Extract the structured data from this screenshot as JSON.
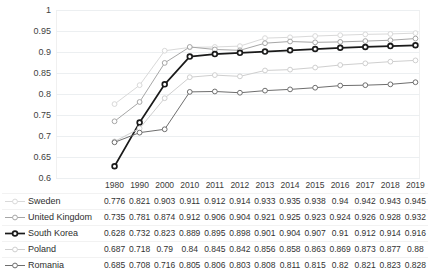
{
  "chart_data": {
    "type": "line",
    "title": "",
    "xlabel": "",
    "ylabel": "",
    "ylim": [
      0.6,
      1
    ],
    "yticks": [
      "0.6",
      "0.65",
      "0.7",
      "0.75",
      "0.8",
      "0.85",
      "0.9",
      "0.95",
      "1"
    ],
    "grid": true,
    "legend_position": "table-left",
    "categories": [
      "1980",
      "1990",
      "2000",
      "2010",
      "2011",
      "2012",
      "2013",
      "2014",
      "2015",
      "2016",
      "2017",
      "2018",
      "2019"
    ],
    "series": [
      {
        "name": "Sweden",
        "color": "#d9d9d9",
        "marker": "circle-open",
        "values": [
          0.776,
          0.821,
          0.903,
          0.911,
          0.912,
          0.914,
          0.933,
          0.935,
          0.938,
          0.94,
          0.942,
          0.943,
          0.945
        ],
        "labels": [
          "0.776",
          "0.821",
          "0.903",
          "0.911",
          "0.912",
          "0.914",
          "0.933",
          "0.935",
          "0.938",
          "0.94",
          "0.942",
          "0.943",
          "0.945"
        ]
      },
      {
        "name": "United Kingdom",
        "color": "#a6a6a6",
        "marker": "circle-open",
        "values": [
          0.735,
          0.781,
          0.874,
          0.912,
          0.906,
          0.904,
          0.921,
          0.925,
          0.923,
          0.924,
          0.926,
          0.928,
          0.932
        ],
        "labels": [
          "0.735",
          "0.781",
          "0.874",
          "0.912",
          "0.906",
          "0.904",
          "0.921",
          "0.925",
          "0.923",
          "0.924",
          "0.926",
          "0.928",
          "0.932"
        ]
      },
      {
        "name": "South Korea",
        "color": "#1a1a1a",
        "marker": "circle-open",
        "values": [
          0.628,
          0.732,
          0.823,
          0.889,
          0.895,
          0.898,
          0.901,
          0.904,
          0.907,
          0.91,
          0.912,
          0.914,
          0.916
        ],
        "labels": [
          "0.628",
          "0.732",
          "0.823",
          "0.889",
          "0.895",
          "0.898",
          "0.901",
          "0.904",
          "0.907",
          "0.91",
          "0.912",
          "0.914",
          "0.916"
        ]
      },
      {
        "name": "Poland",
        "color": "#cfcfcf",
        "marker": "circle-open",
        "values": [
          0.687,
          0.718,
          0.79,
          0.84,
          0.845,
          0.842,
          0.856,
          0.858,
          0.863,
          0.869,
          0.873,
          0.877,
          0.88
        ],
        "labels": [
          "0.687",
          "0.718",
          "0.79",
          "0.84",
          "0.845",
          "0.842",
          "0.856",
          "0.858",
          "0.863",
          "0.869",
          "0.873",
          "0.877",
          "0.88"
        ]
      },
      {
        "name": "Romania",
        "color": "#6e6e6e",
        "marker": "circle-open",
        "values": [
          0.685,
          0.708,
          0.716,
          0.805,
          0.806,
          0.803,
          0.808,
          0.811,
          0.815,
          0.82,
          0.821,
          0.823,
          0.828
        ],
        "labels": [
          "0.685",
          "0.708",
          "0.716",
          "0.805",
          "0.806",
          "0.803",
          "0.808",
          "0.811",
          "0.815",
          "0.82",
          "0.821",
          "0.823",
          "0.828"
        ]
      }
    ]
  },
  "table": {
    "corner_label": "",
    "column_headers": [
      "1980",
      "1990",
      "2000",
      "2010",
      "2011",
      "2012",
      "2013",
      "2014",
      "2015",
      "2016",
      "2017",
      "2018",
      "2019"
    ]
  },
  "colors": {
    "gridline": "#eceff1",
    "text": "#2e2e2e",
    "background": "#ffffff"
  }
}
